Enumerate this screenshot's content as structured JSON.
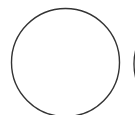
{
  "canvas": {
    "width": 135,
    "height": 115,
    "background": "#ffffff"
  },
  "shapes": {
    "stroke_color": "#333333",
    "main_circle": {
      "cx": 65.5,
      "cy": 62.5,
      "r": 54,
      "stroke_width": 1.4
    },
    "partial_circle": {
      "cx": 188,
      "cy": 64,
      "r": 54,
      "stroke_width": 1.4
    }
  }
}
